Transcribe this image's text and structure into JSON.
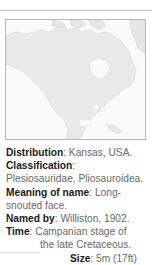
{
  "map": {
    "region": "North America",
    "highlight": "Kansas",
    "land_color": "#e9e9e9",
    "water_color": "#fafafa",
    "border_color": "#b8b8b8"
  },
  "facts": {
    "distribution": {
      "label": "Distribution",
      "value": "Kansas, USA."
    },
    "classification": {
      "label": "Classification",
      "value": "Plesiosauridae, Pliosauroidea."
    },
    "meaning": {
      "label": "Meaning of name",
      "value_line1": "Long-",
      "value_line2": "snouted face."
    },
    "named_by": {
      "label": "Named by",
      "value": "Williston, 1902."
    },
    "time": {
      "label": "Time",
      "value_line1": "Campanian stage of",
      "value_line2": "the late Cretaceous."
    },
    "size": {
      "label": "Size",
      "value": "5m (17ft)"
    }
  },
  "punct": {
    "colon": ":"
  }
}
